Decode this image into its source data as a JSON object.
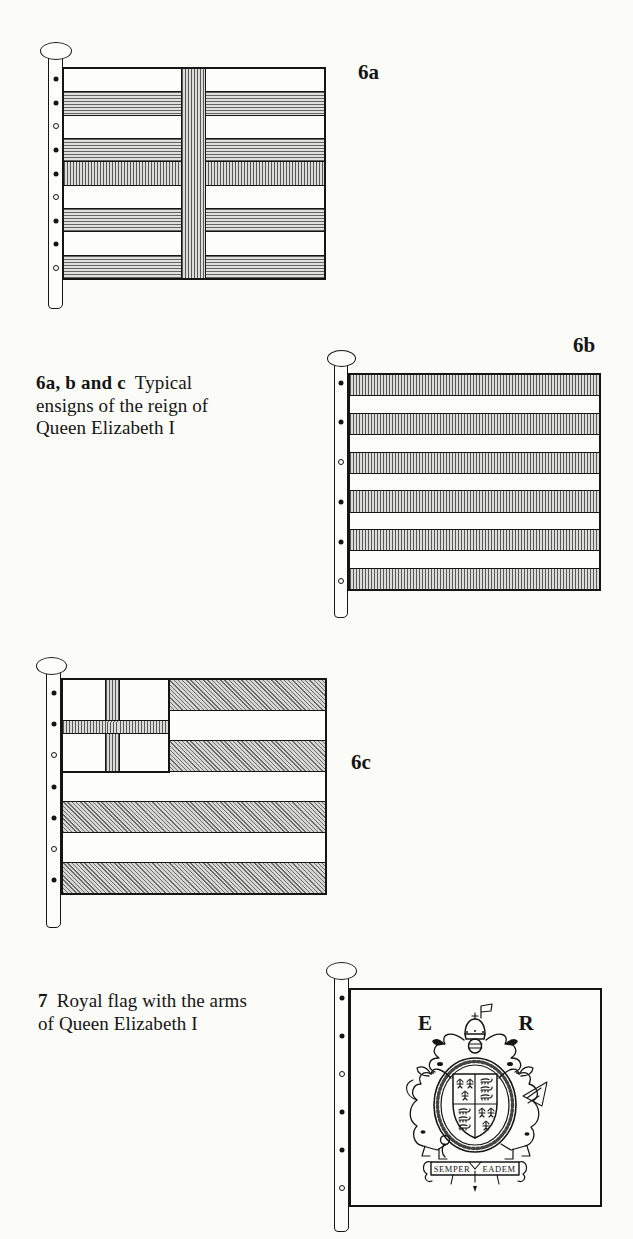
{
  "page": {
    "background": "#fbfbf8",
    "ink": "#151515",
    "kind": "book illustration page"
  },
  "captions": {
    "ensigns": {
      "prefix": "6a, b and c",
      "first_line_rest": "Typical",
      "line2": "ensigns of the reign of",
      "line3": "Queen Elizabeth I"
    },
    "royal": {
      "prefix": "7",
      "first_line_rest": "Royal flag with the arms",
      "line2": "of Queen Elizabeth I"
    }
  },
  "flags": {
    "f6a": {
      "label": "6a",
      "stripes": [
        "white",
        "shade-horizontal",
        "white",
        "shade-horizontal",
        "shade-vertical",
        "white",
        "shade-horizontal",
        "white",
        "shade-horizontal"
      ],
      "cross_band": true,
      "grommets": 9,
      "grommet_fracs": [
        0.056,
        0.167,
        0.278,
        0.389,
        0.5,
        0.611,
        0.722,
        0.833,
        0.944
      ]
    },
    "f6b": {
      "label": "6b",
      "stripes": [
        "shade-vertical",
        "white",
        "shade-vertical",
        "white",
        "shade-vertical",
        "white",
        "shade-vertical",
        "white",
        "shade-vertical",
        "white",
        "shade-vertical"
      ],
      "stripe_weights": [
        1.1,
        0.9,
        1.1,
        0.9,
        1.1,
        0.9,
        1.1,
        0.9,
        1.1,
        0.9,
        1.1
      ],
      "grommets": 6,
      "grommet_fracs": [
        0.045,
        0.227,
        0.409,
        0.591,
        0.773,
        0.955
      ]
    },
    "f6c": {
      "label": "6c",
      "stripes": [
        "shade-diagonal",
        "white",
        "shade-diagonal",
        "white",
        "shade-diagonal",
        "white",
        "shade-diagonal"
      ],
      "canton_cross": "st-george",
      "grommets": 7,
      "grommet_fracs": [
        0.071,
        0.214,
        0.357,
        0.5,
        0.643,
        0.786,
        0.929
      ]
    },
    "f7": {
      "grommets": 6,
      "grommet_fracs": [
        0.046,
        0.219,
        0.392,
        0.566,
        0.74,
        0.913
      ]
    }
  },
  "royal_arms": {
    "initial_left": "E",
    "initial_right": "R",
    "motto_word1": "SEMPER",
    "motto_word2": "EADEM"
  }
}
